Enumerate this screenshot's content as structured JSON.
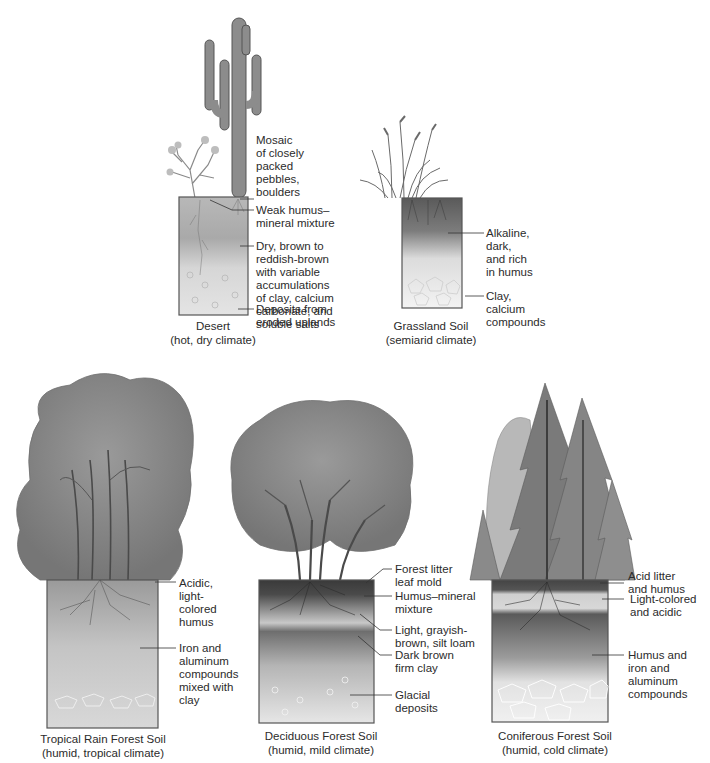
{
  "diagram": {
    "type": "soil-profiles",
    "colors": {
      "ink": "#2b2b2b",
      "column_border": "#555555",
      "background": "#ffffff"
    },
    "profiles": [
      {
        "id": "desert",
        "caption": "Desert\n(hot, dry climate)",
        "vegetation": "saguaro-cactus-and-shrub",
        "labels": [
          "Mosaic\nof closely\npacked\npebbles,\nboulders",
          "Weak humus–\nmineral mixture",
          "Dry, brown to\nreddish-brown\nwith variable\naccumulations\nof clay, calcium\ncarbonate, and\nsoluble salts",
          "Deposits from\neroded uplands"
        ]
      },
      {
        "id": "grassland",
        "caption": "Grassland Soil\n(semiarid climate)",
        "vegetation": "tall-grasses",
        "labels": [
          "Alkaline,\ndark,\nand rich\nin humus",
          "Clay,\ncalcium\ncompounds"
        ]
      },
      {
        "id": "tropical",
        "caption": "Tropical Rain Forest Soil\n(humid, tropical climate)",
        "vegetation": "rainforest-trees",
        "labels": [
          "Acidic,\nlight-\ncolored\nhumus",
          "Iron and\naluminum\ncompounds\nmixed with\nclay"
        ]
      },
      {
        "id": "deciduous",
        "caption": "Deciduous Forest Soil\n(humid, mild climate)",
        "vegetation": "broadleaf-tree",
        "labels": [
          "Forest litter\nleaf mold",
          "Humus–mineral\nmixture",
          "Light, grayish-\nbrown, silt loam",
          "Dark brown\nfirm clay",
          "Glacial\ndeposits"
        ]
      },
      {
        "id": "coniferous",
        "caption": "Coniferous Forest Soil\n(humid, cold climate)",
        "vegetation": "conifer-trees",
        "labels": [
          "Acid litter\nand humus",
          "Light-colored\nand acidic",
          "Humus and\niron and\naluminum\ncompounds"
        ]
      }
    ]
  }
}
